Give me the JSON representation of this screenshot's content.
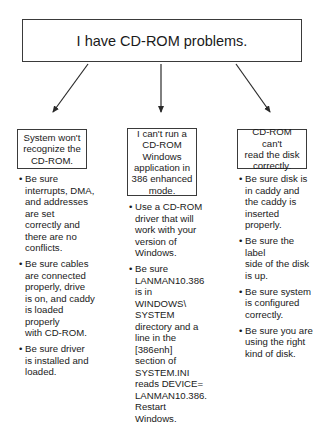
{
  "root": {
    "label": "I have CD-ROM problems."
  },
  "branches": [
    {
      "problem": "System won't\nrecognize the\nCD-ROM.",
      "tips": [
        "Be sure\ninterrupts, DMA,\nand addresses\nare set\ncorrectly and\nthere are no\nconflicts.",
        "Be sure cables\nare connected\nproperly, drive\nis on, and caddy\nis loaded properly\nwith CD-ROM.",
        "Be sure driver\nis installed and\nloaded."
      ]
    },
    {
      "problem": "I can't run a\nCD-ROM\nWindows\napplication in\n386 enhanced\nmode.",
      "tips": [
        "Use a CD-ROM\ndriver that will\nwork with your\nversion of\nWindows.",
        "Be sure\nLANMAN10.386\nis in\nWINDOWS\\\nSYSTEM\ndirectory and a\nline in the [386enh]\nsection of\nSYSTEM.INI\nreads DEVICE=\nLANMAN10.386.\nRestart Windows."
      ]
    },
    {
      "problem": "CD-ROM can't\nread the disk\ncorrectly.",
      "tips": [
        "Be sure disk is\nin caddy and\nthe caddy is\ninserted properly.",
        "Be sure the label\nside of the disk\nis up.",
        "Be sure system\nis configured\ncorrectly.",
        "Be sure you are\nusing the right\nkind of disk."
      ]
    }
  ],
  "bullet_glyph": "•",
  "colors": {
    "line": "#2a2a2a",
    "text": "#1a1a1a",
    "background": "#ffffff"
  }
}
